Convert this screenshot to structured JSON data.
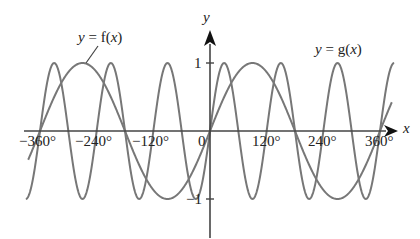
{
  "chart_data": {
    "type": "line",
    "title": "",
    "xlabel": "x",
    "ylabel": "y",
    "xlim": [
      -390,
      390
    ],
    "ylim": [
      -1,
      1
    ],
    "x_ticks": [
      -360,
      -240,
      -120,
      0,
      120,
      240,
      360
    ],
    "x_tick_labels": [
      "−360°",
      "−240°",
      "−120°",
      "0",
      "120°",
      "240°",
      "360°"
    ],
    "y_ticks": [
      1,
      -1
    ],
    "y_tick_labels": [
      "1",
      "−1"
    ],
    "grid": false,
    "legend": "none (inline annotations)",
    "series": [
      {
        "name": "y = f(x)",
        "expression": "sin x",
        "period_deg": 360,
        "amplitude": 1,
        "x_range": [
          -385,
          385
        ]
      },
      {
        "name": "y = g(x)",
        "expression": "sin 3x",
        "period_deg": 120,
        "amplitude": 1,
        "x_range": [
          -390,
          390
        ]
      }
    ],
    "annotations": [
      {
        "text": "y = f(x)",
        "points_to": "f near x = -270°, y = 1"
      },
      {
        "text": "y = g(x)",
        "position": "upper right"
      }
    ]
  },
  "labels": {
    "f_label": "y = f(x)",
    "g_label": "y = g(x)",
    "x_axis": "x",
    "y_axis": "y",
    "origin": "0",
    "y_one": "1",
    "y_minus_one": "−1",
    "xt_m360": "−360°",
    "xt_m240": "−240°",
    "xt_m120": "−120°",
    "xt_120": "120°",
    "xt_240": "240°",
    "xt_360": "360°"
  },
  "colors": {
    "curve": "#777777",
    "axis": "#444444",
    "text": "#222222"
  }
}
